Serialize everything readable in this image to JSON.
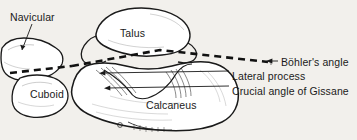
{
  "figure": {
    "background_color": "#f2f0ec",
    "ink_color": "#1a1a1a"
  },
  "bone_labels": [
    {
      "id": "navicular",
      "text": "Navicular",
      "x": 10,
      "y": 12,
      "has_leader": true
    },
    {
      "id": "talus",
      "text": "Talus",
      "x": 120,
      "y": 28,
      "has_leader": false
    },
    {
      "id": "cuboid",
      "text": "Cuboid",
      "x": 30,
      "y": 89,
      "has_leader": false
    },
    {
      "id": "calcaneus",
      "text": "Calcaneus",
      "x": 146,
      "y": 100,
      "has_leader": false
    }
  ],
  "callout_labels": [
    {
      "id": "bohlers-angle",
      "text": "Böhler's angle",
      "x": 281,
      "y": 57
    },
    {
      "id": "lateral-process",
      "text": "Lateral process",
      "x": 232,
      "y": 71
    },
    {
      "id": "crucial-angle",
      "text": "Crucial angle of Gissane",
      "x": 232,
      "y": 86
    }
  ],
  "annotations": {
    "dashed_line_name": "bohlers-angle-dashed-line",
    "dashed_line_style": "heavy black dashed, shallow V shape across the hindfoot",
    "leader_lines": [
      "navicular-leader-line",
      "bohlers-angle-leader-line",
      "lateral-process-leader-line",
      "crucial-angle-leader-line"
    ]
  }
}
